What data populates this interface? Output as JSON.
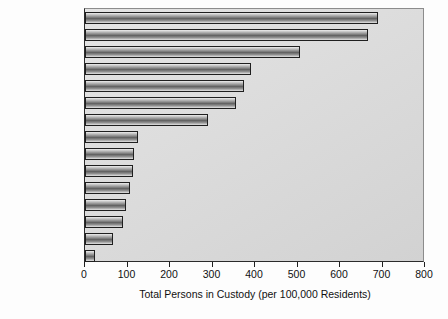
{
  "chart_data": {
    "type": "bar",
    "orientation": "horizontal",
    "title": "",
    "xlabel": "Total Persons in Custody (per 100,000 Residents)",
    "ylabel": "",
    "xlim": [
      0,
      800
    ],
    "xticks": [
      0,
      100,
      200,
      300,
      400,
      500,
      600,
      700,
      800
    ],
    "grid": false,
    "legend": null,
    "categories": [
      "Russia",
      "United States",
      "Belarus",
      "Ukraine",
      "Latvia",
      "Lithuania",
      "Singapore",
      "Canada",
      "China",
      "England/Wales",
      "France",
      "Germany",
      "Turkey",
      "Ireland",
      "India"
    ],
    "values": [
      690,
      665,
      505,
      390,
      375,
      355,
      290,
      125,
      115,
      113,
      105,
      97,
      90,
      65,
      24
    ],
    "bar_fill": "#7a7a7a",
    "bar_edge": "#1f1f1f",
    "plot_background": "#dcdcdc",
    "figure_background": "#ffffff"
  }
}
